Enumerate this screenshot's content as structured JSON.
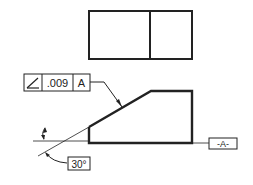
{
  "drawing": {
    "type": "GD&T angularity example",
    "feature_control_frame": {
      "symbol": "angularity-icon",
      "tolerance": ".009",
      "datum": "A"
    },
    "datum_label": "-A-",
    "angle_label": "30°",
    "colors": {
      "line": "#222222",
      "background": "#ffffff"
    }
  }
}
